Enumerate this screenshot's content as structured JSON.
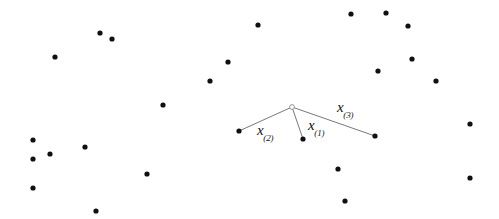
{
  "figure": {
    "width": 499,
    "height": 219,
    "background_color": "#ffffff",
    "point_color": "#101010",
    "line_color": "#555555",
    "origin_marker_color": "#8a8a8a",
    "point_radius": 2.6,
    "origin_radius": 2.4,
    "line_width": 0.8
  },
  "origin": {
    "label": "query-point",
    "x": 292,
    "y": 107,
    "marker": "open-circle"
  },
  "neighbours": [
    {
      "id": "x1",
      "label_base": "x",
      "label_sub": "(1)",
      "x": 303,
      "y": 139,
      "label_x": 308,
      "label_y": 117
    },
    {
      "id": "x2",
      "label_base": "x",
      "label_sub": "(2)",
      "x": 239,
      "y": 131,
      "label_x": 257,
      "label_y": 122
    },
    {
      "id": "x3",
      "label_base": "x",
      "label_sub": "(3)",
      "x": 375,
      "y": 136,
      "label_x": 337,
      "label_y": 99
    }
  ],
  "scatter_points": [
    {
      "x": 100,
      "y": 33
    },
    {
      "x": 112,
      "y": 39
    },
    {
      "x": 55,
      "y": 57
    },
    {
      "x": 163,
      "y": 105
    },
    {
      "x": 210,
      "y": 81
    },
    {
      "x": 228,
      "y": 62
    },
    {
      "x": 258,
      "y": 25
    },
    {
      "x": 351,
      "y": 14
    },
    {
      "x": 386,
      "y": 13
    },
    {
      "x": 408,
      "y": 26
    },
    {
      "x": 378,
      "y": 71
    },
    {
      "x": 412,
      "y": 59
    },
    {
      "x": 436,
      "y": 81
    },
    {
      "x": 470,
      "y": 124
    },
    {
      "x": 470,
      "y": 178
    },
    {
      "x": 338,
      "y": 169
    },
    {
      "x": 345,
      "y": 201
    },
    {
      "x": 147,
      "y": 174
    },
    {
      "x": 96,
      "y": 211
    },
    {
      "x": 33,
      "y": 140
    },
    {
      "x": 50,
      "y": 154
    },
    {
      "x": 33,
      "y": 159
    },
    {
      "x": 33,
      "y": 188
    },
    {
      "x": 85,
      "y": 147
    }
  ],
  "chart_data": {
    "type": "scatter",
    "title": "",
    "xlabel": "",
    "ylabel": "",
    "grid": false,
    "legend": false,
    "annotations": [
      "x(1)",
      "x(2)",
      "x(3)"
    ],
    "series": [
      {
        "name": "data points",
        "marker": "filled-circle",
        "points": [
          [
            100,
            33
          ],
          [
            112,
            39
          ],
          [
            55,
            57
          ],
          [
            163,
            105
          ],
          [
            210,
            81
          ],
          [
            228,
            62
          ],
          [
            258,
            25
          ],
          [
            351,
            14
          ],
          [
            386,
            13
          ],
          [
            408,
            26
          ],
          [
            378,
            71
          ],
          [
            412,
            59
          ],
          [
            436,
            81
          ],
          [
            470,
            124
          ],
          [
            470,
            178
          ],
          [
            338,
            169
          ],
          [
            345,
            201
          ],
          [
            147,
            174
          ],
          [
            96,
            211
          ],
          [
            33,
            140
          ],
          [
            50,
            154
          ],
          [
            33,
            159
          ],
          [
            33,
            188
          ],
          [
            85,
            147
          ]
        ]
      },
      {
        "name": "nearest neighbours",
        "marker": "filled-circle",
        "points": [
          [
            303,
            139
          ],
          [
            239,
            131
          ],
          [
            375,
            136
          ]
        ],
        "labels": [
          "x(1)",
          "x(2)",
          "x(3)"
        ]
      },
      {
        "name": "query point",
        "marker": "open-circle",
        "points": [
          [
            292,
            107
          ]
        ]
      }
    ],
    "connections": [
      {
        "from": [
          292,
          107
        ],
        "to": [
          239,
          131
        ],
        "label": "x(2)"
      },
      {
        "from": [
          292,
          107
        ],
        "to": [
          303,
          139
        ],
        "label": "x(1)"
      },
      {
        "from": [
          292,
          107
        ],
        "to": [
          375,
          136
        ],
        "label": "x(3)"
      }
    ]
  }
}
